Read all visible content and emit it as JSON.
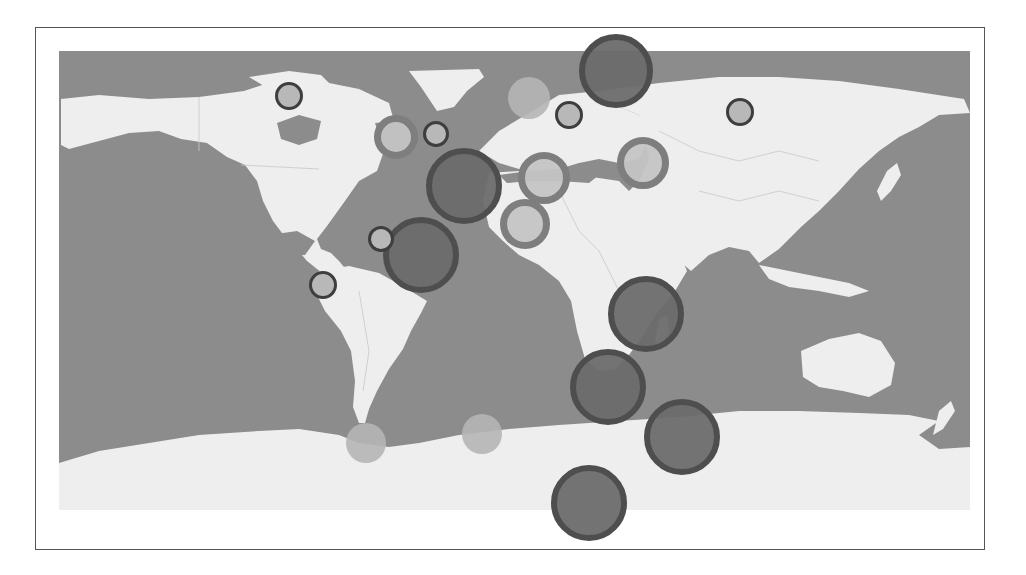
{
  "map": {
    "type": "world-bubble-map",
    "projection": "equirectangular",
    "colors": {
      "ocean": "#8c8c8c",
      "land": "#eeeeee",
      "border": "#c8c8c8",
      "frame": "#555555",
      "background": "#ffffff"
    }
  },
  "styles": {
    "dark": {
      "fill": "#6c6c6c",
      "stroke": "#4e4e4e",
      "stroke_width": 6,
      "opacity": 0.95
    },
    "ring": {
      "fill": "#c4c4c4",
      "stroke": "#7e7e7e",
      "stroke_width": 7,
      "opacity": 0.95
    },
    "small": {
      "fill": "#b8b8b8",
      "stroke": "#3e3e3e",
      "stroke_width": 3,
      "opacity": 1.0
    },
    "light": {
      "fill": "#b5b5b5",
      "stroke": "#9a9a9a",
      "stroke_width": 0,
      "opacity": 0.9
    }
  },
  "bubbles": [
    {
      "id": "b1",
      "region": "barents-sea",
      "cx": 616,
      "cy": 71,
      "r": 37,
      "style": "dark"
    },
    {
      "id": "b2",
      "region": "north-atlantic",
      "cx": 464,
      "cy": 186,
      "r": 38,
      "style": "dark"
    },
    {
      "id": "b3",
      "region": "tropical-atlantic",
      "cx": 421,
      "cy": 255,
      "r": 38,
      "style": "dark"
    },
    {
      "id": "b4",
      "region": "mozambique-channel",
      "cx": 646,
      "cy": 314,
      "r": 38,
      "style": "dark"
    },
    {
      "id": "b5",
      "region": "south-africa-sea",
      "cx": 608,
      "cy": 387,
      "r": 38,
      "style": "dark"
    },
    {
      "id": "b6",
      "region": "southern-indian",
      "cx": 682,
      "cy": 437,
      "r": 38,
      "style": "dark"
    },
    {
      "id": "b7",
      "region": "antarctica-coast",
      "cx": 589,
      "cy": 503,
      "r": 38,
      "style": "dark"
    },
    {
      "id": "b8",
      "region": "mediterranean",
      "cx": 544,
      "cy": 178,
      "r": 26,
      "style": "ring"
    },
    {
      "id": "b9",
      "region": "west-africa",
      "cx": 525,
      "cy": 224,
      "r": 25,
      "style": "ring"
    },
    {
      "id": "b10",
      "region": "central-asia",
      "cx": 643,
      "cy": 163,
      "r": 26,
      "style": "ring"
    },
    {
      "id": "b11",
      "region": "labrador-sea",
      "cx": 396,
      "cy": 137,
      "r": 22,
      "style": "ring"
    },
    {
      "id": "b12",
      "region": "hudson-bay",
      "cx": 289,
      "cy": 96,
      "r": 14,
      "style": "small"
    },
    {
      "id": "b13",
      "region": "north-atlantic-n",
      "cx": 436,
      "cy": 134,
      "r": 13,
      "style": "small"
    },
    {
      "id": "b14",
      "region": "baltic",
      "cx": 569,
      "cy": 115,
      "r": 14,
      "style": "small"
    },
    {
      "id": "b15",
      "region": "siberia",
      "cx": 740,
      "cy": 112,
      "r": 14,
      "style": "small"
    },
    {
      "id": "b16",
      "region": "caribbean",
      "cx": 381,
      "cy": 239,
      "r": 13,
      "style": "small"
    },
    {
      "id": "b17",
      "region": "peru",
      "cx": 323,
      "cy": 285,
      "r": 14,
      "style": "small"
    },
    {
      "id": "b18",
      "region": "norwegian-sea",
      "cx": 529,
      "cy": 98,
      "r": 21,
      "style": "light"
    },
    {
      "id": "b19",
      "region": "drake-passage",
      "cx": 366,
      "cy": 443,
      "r": 20,
      "style": "light"
    },
    {
      "id": "b20",
      "region": "south-atlantic",
      "cx": 482,
      "cy": 434,
      "r": 20,
      "style": "light"
    }
  ]
}
